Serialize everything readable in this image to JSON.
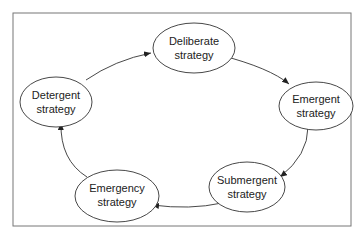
{
  "diagram": {
    "type": "cycle",
    "nodes": [
      {
        "id": "deliberate",
        "line1": "Deliberate",
        "line2": "strategy"
      },
      {
        "id": "emergent",
        "line1": "Emergent",
        "line2": "strategy"
      },
      {
        "id": "submergent",
        "line1": "Submergent",
        "line2": "strategy"
      },
      {
        "id": "emergency",
        "line1": "Emergency",
        "line2": "strategy"
      },
      {
        "id": "detergent",
        "line1": "Detergent",
        "line2": "strategy"
      }
    ],
    "edges": [
      {
        "from": "deliberate",
        "to": "emergent"
      },
      {
        "from": "emergent",
        "to": "submergent"
      },
      {
        "from": "submergent",
        "to": "emergency"
      },
      {
        "from": "emergency",
        "to": "detergent"
      },
      {
        "from": "detergent",
        "to": "deliberate"
      }
    ]
  }
}
